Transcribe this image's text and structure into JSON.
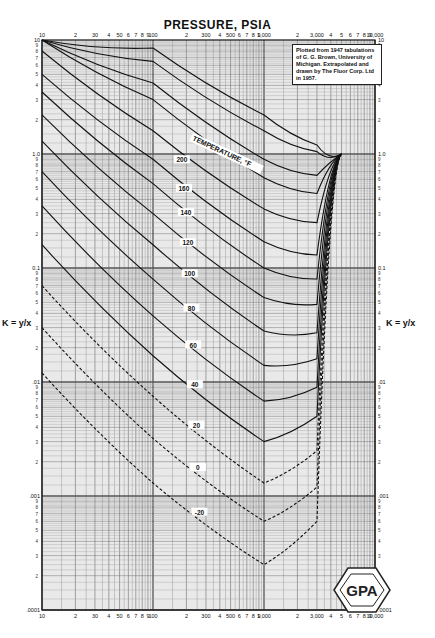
{
  "chart_data": {
    "type": "line",
    "title": "PRESSURE, PSIA",
    "xlabel": "PRESSURE, PSIA",
    "ylabel": "K = y/x",
    "x_scale": "log",
    "y_scale": "log",
    "xlim": [
      10,
      10000
    ],
    "ylim": [
      0.0001,
      10
    ],
    "grid": true,
    "x_ticks_top": [
      "10",
      "2",
      "30",
      "4",
      "50",
      "6",
      "7",
      "8",
      "9",
      "100",
      "2",
      "300",
      "4",
      "500",
      "6",
      "7",
      "8",
      "9",
      "1,000",
      "2",
      "3,000",
      "4",
      "5",
      "6",
      "7",
      "8",
      "9",
      "10,000"
    ],
    "x_ticks_bottom": [
      "10",
      "2",
      "30",
      "4",
      "50",
      "6",
      "7",
      "8",
      "9",
      "100",
      "2",
      "300",
      "4",
      "500",
      "6",
      "7",
      "8",
      "9",
      "1,000",
      "2",
      "3,000",
      "4",
      "5",
      "6",
      "7",
      "8",
      "9",
      "10,000"
    ],
    "y_ticks_left": [
      "10",
      "1.0",
      "0.1",
      ".01",
      ".001",
      ".0001"
    ],
    "y_ticks_right": [
      "10",
      "1.0",
      "0.1",
      ".01",
      ".001",
      ".0001"
    ],
    "curve_label_header": "TEMPERATURE, °F",
    "convergence_pressure_psia": 5000,
    "series_labels_visible": [
      "160",
      "140",
      "120",
      "100",
      "80",
      "60",
      "40",
      "20",
      "0",
      "-20"
    ],
    "series": [
      {
        "name": "500",
        "x": [
          10,
          100,
          1000,
          3000,
          5000
        ],
        "y": [
          10,
          8.5,
          2.2,
          1.2,
          1.0
        ]
      },
      {
        "name": "400",
        "x": [
          10,
          100,
          1000,
          3000,
          5000
        ],
        "y": [
          10,
          6.5,
          1.6,
          1.05,
          1.0
        ]
      },
      {
        "name": "300",
        "x": [
          10,
          100,
          1000,
          3000,
          5000
        ],
        "y": [
          10,
          4.2,
          0.9,
          0.65,
          1.0
        ]
      },
      {
        "name": "260",
        "x": [
          10,
          100,
          1000,
          3000,
          5000
        ],
        "y": [
          10,
          3.0,
          0.62,
          0.45,
          1.0
        ]
      },
      {
        "name": "200",
        "x": [
          10,
          100,
          1000,
          3000,
          5000
        ],
        "y": [
          8.0,
          1.6,
          0.33,
          0.25,
          1.0
        ]
      },
      {
        "name": "160",
        "x": [
          10,
          100,
          1000,
          3000,
          5000
        ],
        "y": [
          5.0,
          0.9,
          0.17,
          0.13,
          1.0
        ]
      },
      {
        "name": "140",
        "x": [
          10,
          100,
          1000,
          3000,
          5000
        ],
        "y": [
          3.5,
          0.55,
          0.1,
          0.08,
          1.0
        ]
      },
      {
        "name": "120",
        "x": [
          10,
          100,
          1000,
          3000,
          5000
        ],
        "y": [
          2.2,
          0.3,
          0.055,
          0.048,
          1.0
        ]
      },
      {
        "name": "100",
        "x": [
          10,
          100,
          1000,
          3000,
          5000
        ],
        "y": [
          1.3,
          0.16,
          0.028,
          0.027,
          1.0
        ]
      },
      {
        "name": "80",
        "x": [
          10,
          100,
          1000,
          3000,
          5000
        ],
        "y": [
          0.7,
          0.08,
          0.014,
          0.016,
          1.0
        ]
      },
      {
        "name": "60",
        "x": [
          10,
          100,
          1000,
          3000,
          5000
        ],
        "y": [
          0.35,
          0.038,
          0.0068,
          0.009,
          1.0
        ]
      },
      {
        "name": "40",
        "x": [
          10,
          100,
          1000,
          3000,
          5000
        ],
        "y": [
          0.16,
          0.017,
          0.003,
          0.005,
          1.0
        ]
      },
      {
        "name": "20",
        "x": [
          10,
          100,
          1000,
          3000,
          5000
        ],
        "y": [
          0.07,
          0.0075,
          0.0013,
          0.0025,
          1.0
        ]
      },
      {
        "name": "0",
        "x": [
          10,
          100,
          1000,
          3000,
          5000
        ],
        "y": [
          0.03,
          0.0032,
          0.0006,
          0.0012,
          1.0
        ]
      },
      {
        "name": "-20",
        "x": [
          10,
          100,
          1000,
          3000,
          5000
        ],
        "y": [
          0.012,
          0.0013,
          0.00025,
          0.0006,
          1.0
        ]
      }
    ],
    "annotations": [
      "Plotted from 1947 tabulations of G. G. Brown, University of Michigan. Extrapolated and drawn by The Fluor Corp. Ltd in 1957."
    ],
    "logo": "GPA"
  },
  "header": {
    "title": "PRESSURE, PSIA"
  },
  "axes": {
    "left_label": "K = y/x",
    "right_label": "K = y/x"
  },
  "note": {
    "text": "Plotted from 1947 tabulations of G. G. Brown, University of Michigan. Extrapolated and drawn by The Fluor Corp. Ltd in 1957."
  },
  "logo": {
    "text": "GPA"
  }
}
